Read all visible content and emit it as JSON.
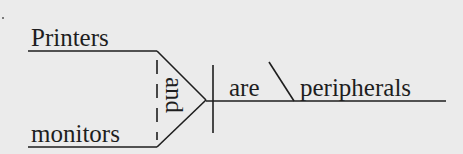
{
  "diagram": {
    "type": "sentence-diagram",
    "sentence": "Printers and monitors are peripherals",
    "subjects": [
      "Printers",
      "monitors"
    ],
    "conjunction": "and",
    "verb": "are",
    "complement": "peripherals",
    "complement_type": "predicate-nominative",
    "colors": {
      "ink": "#1e1e1e",
      "paper": "#ebebeb"
    }
  }
}
